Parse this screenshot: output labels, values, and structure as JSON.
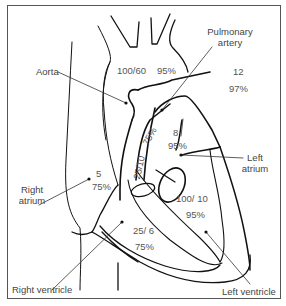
{
  "diagram": {
    "labels": {
      "aorta": "Aorta",
      "pulmonary_artery_line1": "Pulmonary",
      "pulmonary_artery_line2": "artery",
      "right_atrium_line1": "Right",
      "right_atrium_line2": "atrium",
      "left_atrium_line1": "Left",
      "left_atrium_line2": "atrium",
      "right_ventricle": "Right ventricle",
      "left_ventricle": "Left ventricle"
    },
    "values": {
      "aorta_pressure": "100/60",
      "aorta_saturation": "95%",
      "pulmonary_artery_pressure": "25/10",
      "pulmonary_artery_saturation": "75%",
      "pulmonary_vein_pressure": "12",
      "pulmonary_vein_saturation": "97%",
      "left_atrium_pressure": "8",
      "left_atrium_saturation": "95%",
      "right_atrium_pressure": "5",
      "right_atrium_saturation": "75%",
      "left_ventricle_pressure": "100/ 10",
      "left_ventricle_saturation": "95%",
      "right_ventricle_pressure": "25/ 6",
      "right_ventricle_saturation": "75%"
    },
    "colors": {
      "line": "#111111",
      "pointer": "#333333",
      "text": "#444444",
      "frame": "#555555"
    }
  }
}
